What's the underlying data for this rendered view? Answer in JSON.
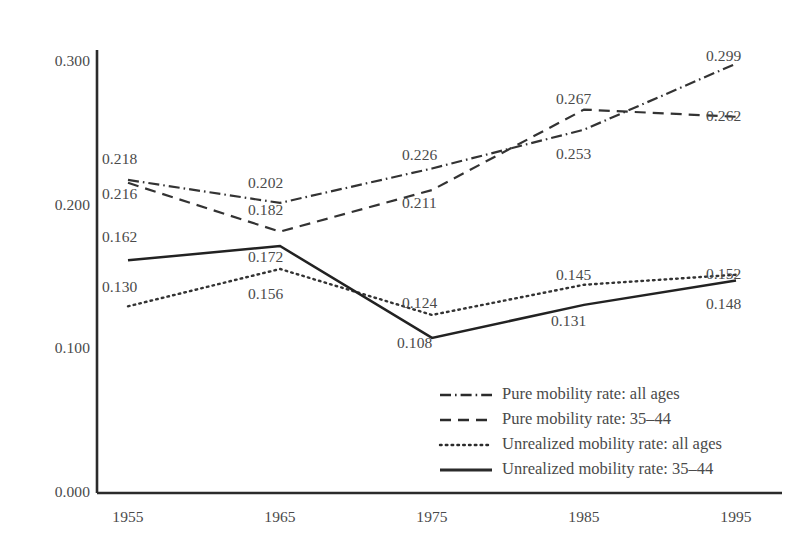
{
  "chart_data": {
    "type": "line",
    "title": "",
    "subtitle": "",
    "xlabel": "",
    "ylabel": "",
    "x": [
      1955,
      1965,
      1975,
      1985,
      1995
    ],
    "categories": [
      "1955",
      "1965",
      "1975",
      "1985",
      "1995"
    ],
    "xtick_labels": [
      "1955",
      "1965",
      "1975",
      "1985",
      "1995"
    ],
    "ytick_labels": [
      "0.300",
      "0.200",
      "0.100",
      "0.000"
    ],
    "ytick_values": [
      0.3,
      0.2,
      0.1,
      0.0
    ],
    "ylim": [
      0.0,
      0.32
    ],
    "xlim": [
      1952,
      1999
    ],
    "grid": false,
    "legend_position": "inside-lower-right",
    "series": [
      {
        "name": "Pure mobility rate: all ages",
        "key": "pure_all_ages",
        "style": "dash-dot",
        "color": "#333333",
        "values": [
          0.218,
          0.202,
          0.226,
          0.253,
          0.299
        ],
        "labels": [
          "0.218",
          "0.202",
          "0.226",
          "0.253",
          "0.299"
        ]
      },
      {
        "name": "Pure mobility rate: 35–44",
        "key": "pure_35_44",
        "style": "dashed",
        "color": "#333333",
        "values": [
          0.216,
          0.182,
          0.211,
          0.267,
          0.262
        ],
        "labels": [
          "0.216",
          "0.182",
          "0.211",
          "0.267",
          "0.262"
        ]
      },
      {
        "name": "Unrealized mobility rate: all ages",
        "key": "unrealized_all_ages",
        "style": "dotted",
        "color": "#333333",
        "values": [
          0.13,
          0.156,
          0.124,
          0.145,
          0.152
        ],
        "labels": [
          "0.130",
          "0.156",
          "0.124",
          "0.145",
          "0.152"
        ]
      },
      {
        "name": "Unrealized mobility rate: 35–44",
        "key": "unrealized_35_44",
        "style": "solid",
        "color": "#222222",
        "values": [
          0.162,
          0.172,
          0.108,
          0.131,
          0.148
        ],
        "labels": [
          "0.162",
          "0.172",
          "0.108",
          "0.131",
          "0.148"
        ]
      }
    ],
    "point_labels": [
      {
        "series": "pure_all_ages",
        "x": "1955",
        "text": "0.218"
      },
      {
        "series": "pure_35_44",
        "x": "1955",
        "text": "0.216"
      },
      {
        "series": "unrealized_35_44",
        "x": "1955",
        "text": "0.162"
      },
      {
        "series": "unrealized_all_ages",
        "x": "1955",
        "text": "0.130"
      },
      {
        "series": "pure_all_ages",
        "x": "1965",
        "text": "0.202"
      },
      {
        "series": "pure_35_44",
        "x": "1965",
        "text": "0.182"
      },
      {
        "series": "unrealized_35_44",
        "x": "1965",
        "text": "0.172"
      },
      {
        "series": "unrealized_all_ages",
        "x": "1965",
        "text": "0.156"
      },
      {
        "series": "pure_all_ages",
        "x": "1975",
        "text": "0.226"
      },
      {
        "series": "pure_35_44",
        "x": "1975",
        "text": "0.211"
      },
      {
        "series": "unrealized_all_ages",
        "x": "1975",
        "text": "0.124"
      },
      {
        "series": "unrealized_35_44",
        "x": "1975",
        "text": "0.108"
      },
      {
        "series": "pure_35_44",
        "x": "1985",
        "text": "0.267"
      },
      {
        "series": "pure_all_ages",
        "x": "1985",
        "text": "0.253"
      },
      {
        "series": "unrealized_all_ages",
        "x": "1985",
        "text": "0.145"
      },
      {
        "series": "unrealized_35_44",
        "x": "1985",
        "text": "0.131"
      },
      {
        "series": "pure_all_ages",
        "x": "1995",
        "text": "0.299"
      },
      {
        "series": "pure_35_44",
        "x": "1995",
        "text": "0.262"
      },
      {
        "series": "unrealized_all_ages",
        "x": "1995",
        "text": "0.152"
      },
      {
        "series": "unrealized_35_44",
        "x": "1995",
        "text": "0.148"
      }
    ]
  },
  "axes": {
    "y_ticks": [
      {
        "label": "0.300",
        "value": 0.3
      },
      {
        "label": "0.200",
        "value": 0.2
      },
      {
        "label": "0.100",
        "value": 0.1
      },
      {
        "label": "0.000",
        "value": 0.0
      }
    ],
    "x_ticks": [
      {
        "label": "1955",
        "value": 1955
      },
      {
        "label": "1965",
        "value": 1965
      },
      {
        "label": "1975",
        "value": 1975
      },
      {
        "label": "1985",
        "value": 1985
      },
      {
        "label": "1995",
        "value": 1995
      }
    ],
    "axis_color": "#2b2b2b"
  },
  "legend": {
    "items": [
      {
        "label": "Pure mobility rate: all ages",
        "style": "dash-dot"
      },
      {
        "label": "Pure mobility rate: 35–44",
        "style": "dashed"
      },
      {
        "label": "Unrealized mobility rate: all ages",
        "style": "dotted"
      },
      {
        "label": "Unrealized mobility rate: 35–44",
        "style": "solid"
      }
    ]
  },
  "data_label_positions": [
    {
      "text": "0.218",
      "left": 102,
      "top": 150
    },
    {
      "text": "0.216",
      "left": 102,
      "top": 185
    },
    {
      "text": "0.162",
      "left": 102,
      "top": 228
    },
    {
      "text": "0.130",
      "left": 102,
      "top": 278
    },
    {
      "text": "0.202",
      "left": 248,
      "top": 174
    },
    {
      "text": "0.182",
      "left": 248,
      "top": 201
    },
    {
      "text": "0.172",
      "left": 248,
      "top": 248
    },
    {
      "text": "0.156",
      "left": 248,
      "top": 285
    },
    {
      "text": "0.226",
      "left": 402,
      "top": 146
    },
    {
      "text": "0.211",
      "left": 402,
      "top": 194
    },
    {
      "text": "0.124",
      "left": 402,
      "top": 294
    },
    {
      "text": "0.108",
      "left": 397,
      "top": 334
    },
    {
      "text": "0.267",
      "left": 556,
      "top": 90
    },
    {
      "text": "0.253",
      "left": 556,
      "top": 145
    },
    {
      "text": "0.145",
      "left": 556,
      "top": 266
    },
    {
      "text": "0.131",
      "left": 551,
      "top": 312
    },
    {
      "text": "0.299",
      "left": 706,
      "top": 47
    },
    {
      "text": "0.262",
      "left": 706,
      "top": 107
    },
    {
      "text": "0.152",
      "left": 706,
      "top": 265
    },
    {
      "text": "0.148",
      "left": 706,
      "top": 295
    }
  ]
}
